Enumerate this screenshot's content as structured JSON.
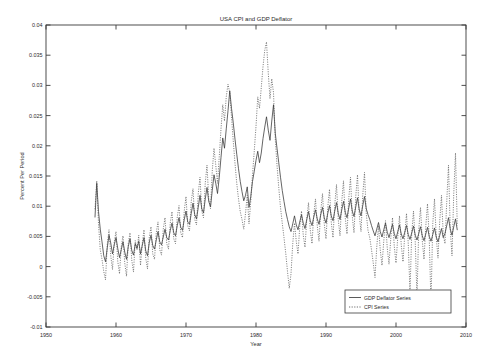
{
  "chart_data": {
    "type": "line",
    "title": "USA CPI and GDP Deflator",
    "xlabel": "Year",
    "ylabel": "Percent Per Period",
    "xlim": [
      1950,
      2010
    ],
    "ylim": [
      -0.01,
      0.04
    ],
    "grid": false,
    "legend_position": "bottom-right",
    "xticks": [
      1950,
      1960,
      1970,
      1980,
      1990,
      2000,
      2010
    ],
    "xtick_labels": [
      "1950",
      "1960",
      "1970",
      "1980",
      "1990",
      "2000",
      "2010"
    ],
    "yticks": [
      -0.01,
      -0.005,
      0,
      0.005,
      0.01,
      0.015,
      0.02,
      0.025,
      0.03,
      0.035,
      0.04
    ],
    "ytick_labels": [
      "-0.01",
      "-0.005",
      "0",
      "0.005",
      "0.01",
      "0.015",
      "0.02",
      "0.025",
      "0.03",
      "0.035",
      "0.04"
    ],
    "x_start": 1957.0,
    "x_end": 2008.75,
    "x_step": 0.25,
    "series": [
      {
        "name": "GDP Deflator Series",
        "style": "solid",
        "color": "#313131",
        "values": [
          0.0082,
          0.0138,
          0.0091,
          0.0062,
          0.0041,
          0.0018,
          0.0008,
          0.0031,
          0.0052,
          0.0039,
          0.0021,
          0.0036,
          0.0048,
          0.003,
          0.0015,
          0.0028,
          0.0041,
          0.0024,
          0.0012,
          0.0033,
          0.0046,
          0.0027,
          0.0019,
          0.0038,
          0.003,
          0.0042,
          0.0021,
          0.0035,
          0.0048,
          0.0026,
          0.0018,
          0.004,
          0.0052,
          0.0035,
          0.0029,
          0.0044,
          0.0058,
          0.0041,
          0.0036,
          0.0049,
          0.0062,
          0.0048,
          0.0044,
          0.006,
          0.0072,
          0.0056,
          0.0051,
          0.0068,
          0.0081,
          0.0065,
          0.006,
          0.0078,
          0.0092,
          0.0074,
          0.007,
          0.0088,
          0.0105,
          0.0086,
          0.0079,
          0.0098,
          0.0118,
          0.0096,
          0.0089,
          0.0112,
          0.0131,
          0.0108,
          0.0099,
          0.0126,
          0.0152,
          0.0138,
          0.0121,
          0.0148,
          0.0181,
          0.0213,
          0.0196,
          0.0228,
          0.0258,
          0.0291,
          0.0262,
          0.0238,
          0.0211,
          0.0186,
          0.0162,
          0.0141,
          0.0124,
          0.0109,
          0.0118,
          0.0132,
          0.0098,
          0.0116,
          0.0141,
          0.0158,
          0.0176,
          0.0191,
          0.0172,
          0.0188,
          0.0212,
          0.0231,
          0.0248,
          0.0226,
          0.0209,
          0.0241,
          0.0268,
          0.0221,
          0.0196,
          0.0172,
          0.0148,
          0.0126,
          0.0108,
          0.0091,
          0.0078,
          0.0066,
          0.0058,
          0.0071,
          0.0084,
          0.0069,
          0.0061,
          0.0074,
          0.0086,
          0.0072,
          0.0063,
          0.0078,
          0.0091,
          0.0076,
          0.0068,
          0.0082,
          0.0094,
          0.0079,
          0.007,
          0.0086,
          0.0098,
          0.0081,
          0.0072,
          0.0088,
          0.0101,
          0.0084,
          0.0076,
          0.0092,
          0.0106,
          0.0088,
          0.0078,
          0.0094,
          0.0108,
          0.009,
          0.0081,
          0.0097,
          0.0112,
          0.0092,
          0.0083,
          0.0099,
          0.0114,
          0.0094,
          0.0084,
          0.0101,
          0.0116,
          0.0096,
          0.0086,
          0.0078,
          0.0068,
          0.0059,
          0.0051,
          0.0062,
          0.0073,
          0.0058,
          0.0049,
          0.0061,
          0.0072,
          0.0057,
          0.0048,
          0.0059,
          0.007,
          0.0055,
          0.0046,
          0.0058,
          0.0069,
          0.0054,
          0.0046,
          0.0057,
          0.0068,
          0.0053,
          0.0045,
          0.0056,
          0.0067,
          0.0052,
          0.0044,
          0.0055,
          0.0066,
          0.0051,
          0.0043,
          0.0054,
          0.0065,
          0.005,
          0.0042,
          0.0053,
          0.0064,
          0.0049,
          0.0041,
          0.0052,
          0.0063,
          0.0048,
          0.0055,
          0.0068,
          0.0081,
          0.0062,
          0.0052,
          0.0066,
          0.0079,
          0.0061,
          0.0051,
          0.0064,
          0.0078,
          0.006,
          0.007,
          0.0084,
          0.0098,
          0.0076
        ]
      },
      {
        "name": "CPI Series",
        "style": "dotted",
        "color": "#4a4a4a",
        "values": [
          0.0095,
          0.0142,
          0.0071,
          0.0028,
          0.0012,
          -0.0008,
          -0.0022,
          0.0036,
          0.0061,
          0.0018,
          -0.0005,
          0.0041,
          0.0058,
          0.0009,
          -0.0012,
          0.0033,
          0.0051,
          0.0006,
          -0.0016,
          0.0038,
          0.0056,
          0.0011,
          -0.0009,
          0.0043,
          0.0028,
          0.0052,
          0.0002,
          0.0038,
          0.0061,
          0.0014,
          -0.0004,
          0.0048,
          0.0066,
          0.0021,
          0.0012,
          0.0056,
          0.0074,
          0.0028,
          0.0019,
          0.0062,
          0.0081,
          0.0038,
          0.0029,
          0.0072,
          0.0091,
          0.0046,
          0.0038,
          0.0082,
          0.0101,
          0.0056,
          0.0048,
          0.0092,
          0.0116,
          0.0068,
          0.0059,
          0.0108,
          0.0129,
          0.0078,
          0.0069,
          0.0121,
          0.0148,
          0.0092,
          0.0081,
          0.0138,
          0.0168,
          0.0112,
          0.0096,
          0.0158,
          0.0196,
          0.0168,
          0.0138,
          0.0182,
          0.0228,
          0.0268,
          0.0241,
          0.0281,
          0.0302,
          0.0288,
          0.0248,
          0.0208,
          0.0171,
          0.0138,
          0.0112,
          0.0091,
          0.0078,
          0.0062,
          0.0088,
          0.0118,
          0.0071,
          0.0108,
          0.0152,
          0.0191,
          0.0232,
          0.0281,
          0.0262,
          0.0296,
          0.0331,
          0.0358,
          0.0372,
          0.0321,
          0.0278,
          0.0311,
          0.0288,
          0.0212,
          0.0168,
          0.0131,
          0.0098,
          0.0072,
          0.0048,
          0.0022,
          -0.0008,
          -0.0036,
          -0.0012,
          0.0038,
          0.0072,
          0.0042,
          0.0021,
          0.0066,
          0.0092,
          0.0052,
          0.0032,
          0.0078,
          0.0106,
          0.0061,
          0.0038,
          0.0086,
          0.0112,
          0.0068,
          0.0042,
          0.0092,
          0.0121,
          0.0071,
          0.0046,
          0.0098,
          0.0128,
          0.0074,
          0.0048,
          0.0102,
          0.0136,
          0.0078,
          0.0051,
          0.0108,
          0.0142,
          0.0081,
          0.0054,
          0.0112,
          0.0148,
          0.0084,
          0.0056,
          0.0116,
          0.0152,
          0.0086,
          0.0058,
          0.0118,
          0.0156,
          0.0088,
          0.006,
          0.0048,
          0.0028,
          0.0006,
          -0.0018,
          0.0032,
          0.0068,
          0.0028,
          0.0002,
          0.0042,
          0.0076,
          0.0031,
          0.0004,
          0.0046,
          0.0081,
          0.0034,
          0.0006,
          0.0048,
          0.0084,
          0.0036,
          0.0008,
          0.0052,
          0.0088,
          0.0038,
          -0.0042,
          0.0056,
          0.0092,
          0.0041,
          -0.0051,
          0.0061,
          0.0098,
          0.0044,
          0.0012,
          0.0066,
          0.0104,
          0.0046,
          -0.0062,
          0.0071,
          0.0112,
          0.0049,
          0.0014,
          0.0076,
          0.0118,
          0.0052,
          0.0038,
          0.0108,
          0.0168,
          0.0062,
          0.0018,
          0.0121,
          0.0188,
          0.0068,
          -0.0082,
          0.0128,
          0.0202,
          0.0071,
          0.0088,
          0.0182,
          0.0221,
          0.0048
        ]
      }
    ]
  },
  "plot_geometry": {
    "left": 46,
    "top": 25,
    "right": 466,
    "bottom": 327
  },
  "legend": {
    "entries": [
      {
        "label": "GDP Deflator Series",
        "style": "solid"
      },
      {
        "label": "CPI Series",
        "style": "dotted"
      }
    ],
    "box": {
      "x": 345,
      "y": 290,
      "w": 106,
      "h": 23
    }
  }
}
